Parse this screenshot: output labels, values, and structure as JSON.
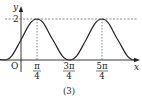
{
  "figure": {
    "caption": "(3)",
    "axes": {
      "x_label": "x",
      "y_label": "y",
      "origin_label": "O"
    },
    "y_ticks": [
      {
        "label": "2",
        "value": 2
      }
    ],
    "x_ticks": [
      {
        "numerator": "π",
        "denominator": "4",
        "value": "π/4"
      },
      {
        "numerator": "3π",
        "denominator": "4",
        "value": "3π/4"
      },
      {
        "numerator": "5π",
        "denominator": "4",
        "value": "5π/4"
      }
    ],
    "curve": {
      "description": "sinusoid oscillating between 0 and 2, maxima at π/4 and 5π/4, minimum at 3π/4",
      "min": 0,
      "max": 2,
      "period": "π"
    },
    "colors": {
      "ink": "#222222",
      "dashed": "#555555"
    }
  }
}
